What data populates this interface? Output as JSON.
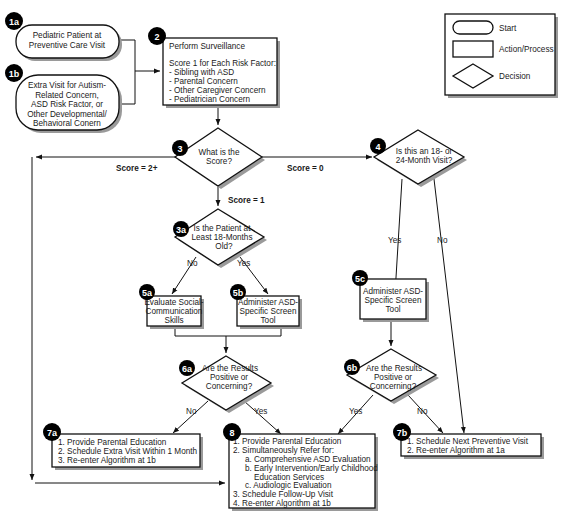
{
  "legend": {
    "items": [
      {
        "shape": "start",
        "label": "Start"
      },
      {
        "shape": "action",
        "label": "Action/Process"
      },
      {
        "shape": "decision",
        "label": "Decision"
      }
    ]
  },
  "nodes": {
    "n1a": {
      "badge": "1a",
      "type": "start",
      "lines": [
        "Pediatric Patient at",
        "Preventive Care Visit"
      ]
    },
    "n1b": {
      "badge": "1b",
      "type": "start",
      "lines": [
        "Extra Visit for Autism-",
        "Related Concern,",
        "ASD Risk Factor, or",
        "Other Developmental/",
        "Behavioral Conern"
      ]
    },
    "n2": {
      "badge": "2",
      "type": "action",
      "title": "Perform Surveillance",
      "lines": [
        "Score 1 for Each Risk Factor:",
        "- Sibling with ASD",
        "- Parental Concern",
        "- Other Caregiver Concern",
        "- Pediatrician Concern"
      ]
    },
    "n3": {
      "badge": "3",
      "type": "decision",
      "lines": [
        "What is the",
        "Score?"
      ]
    },
    "n4": {
      "badge": "4",
      "type": "decision",
      "lines": [
        "Is this an 18- or",
        "24-Month Visit?"
      ]
    },
    "n3a": {
      "badge": "3a",
      "type": "decision",
      "lines": [
        "Is the Patient at",
        "Least 18-Months",
        "Old?"
      ]
    },
    "n5a": {
      "badge": "5a",
      "type": "action",
      "lines": [
        "Evaluate Social-",
        "Communication",
        "Skills"
      ]
    },
    "n5b": {
      "badge": "5b",
      "type": "action",
      "lines": [
        "Administer ASD-",
        "Specific Screen",
        "Tool"
      ]
    },
    "n5c": {
      "badge": "5c",
      "type": "action",
      "lines": [
        "Administer ASD-",
        "Specific Screen",
        "Tool"
      ]
    },
    "n6a": {
      "badge": "6a",
      "type": "decision",
      "lines": [
        "Are the Results",
        "Positive or",
        "Concerning?"
      ]
    },
    "n6b": {
      "badge": "6b",
      "type": "decision",
      "lines": [
        "Are the Results",
        "Positive or",
        "Concerning?"
      ]
    },
    "n7a": {
      "badge": "7a",
      "type": "action",
      "lines": [
        "1.  Provide Parental Education",
        "2.  Schedule Extra Visit Within 1 Month",
        "3.  Re-enter Algorithm at 1b"
      ]
    },
    "n7b": {
      "badge": "7b",
      "type": "action",
      "lines": [
        "1.  Schedule Next Preventive Visit",
        "2.  Re-enter Algorithm at 1a"
      ]
    },
    "n8": {
      "badge": "8",
      "type": "action",
      "lines": [
        "1.  Provide Parental Education",
        "2.  Simultaneously Refer for:",
        "a. Comprehensive ASD Evaluation",
        "b. Early Intervention/Early Childhood",
        "Education Services",
        "c. Audiologic Evaluation",
        "3.  Schedule Follow-Up Visit",
        "4.  Re-enter Algorithm at 1b"
      ]
    }
  },
  "edge_labels": {
    "score2": "Score = 2+",
    "score0": "Score = 0",
    "score1": "Score = 1",
    "n3a_no": "No",
    "n3a_yes": "Yes",
    "n4_yes": "Yes",
    "n4_no": "No",
    "n6a_no": "No",
    "n6a_yes": "Yes",
    "n6b_yes": "Yes",
    "n6b_no": "No"
  }
}
